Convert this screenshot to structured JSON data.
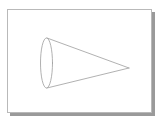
{
  "figure": {
    "title": "Cone",
    "caption": "",
    "description": "Line drawing of a cone lying on its side with an elliptical base at the left and the apex pointing to the right",
    "panel": {
      "background_color": "#ffffff",
      "border_color": "#b9b9b9",
      "shadow_color": "#9a9a9a",
      "x": 7,
      "y": 9,
      "width": 145,
      "height": 104
    },
    "stroke_color": "#9d9d9d",
    "stroke_width": 0.8,
    "fill_color": "none",
    "shapes": [
      {
        "name": "cone-base-ellipse",
        "type": "ellipse",
        "cx": 46.5,
        "cy": 63,
        "rx": 6,
        "ry": 25,
        "label": "base ellipse"
      },
      {
        "name": "cone-upper-edge",
        "type": "line",
        "x1": 47,
        "y1": 38,
        "x2": 129,
        "y2": 68,
        "label": "upper slant edge"
      },
      {
        "name": "cone-lower-edge",
        "type": "line",
        "x1": 47,
        "y1": 88,
        "x2": 129,
        "y2": 68,
        "label": "lower slant edge"
      }
    ],
    "apex": {
      "name": "cone-apex",
      "x": 129,
      "y": 68
    }
  }
}
